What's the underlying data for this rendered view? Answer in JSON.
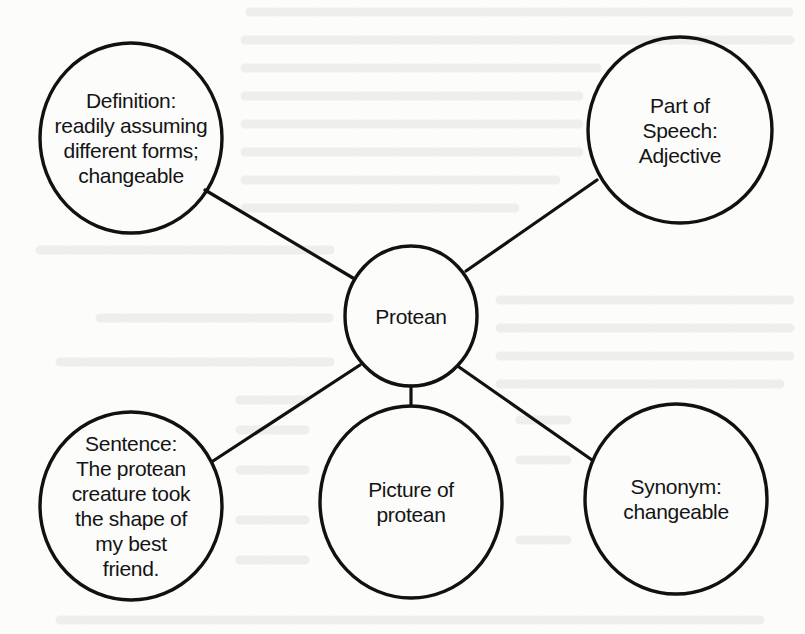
{
  "diagram": {
    "type": "word-map",
    "stroke_color": "#111111",
    "background_color": "#fcfcfb",
    "center": {
      "id": "protean",
      "label": "Protean",
      "cx": 411,
      "cy": 316,
      "rx": 66,
      "ry": 70
    },
    "nodes": [
      {
        "id": "definition",
        "label": "Definition:\nreadily assuming\ndifferent forms;\nchangeable",
        "cx": 131,
        "cy": 138,
        "rx": 91,
        "ry": 95
      },
      {
        "id": "part-of-speech",
        "label": "Part of\nSpeech:\nAdjective",
        "cx": 680,
        "cy": 130,
        "rx": 92,
        "ry": 93
      },
      {
        "id": "sentence",
        "label": "Sentence:\nThe protean\ncreature took\nthe shape of\nmy best\nfriend.",
        "cx": 131,
        "cy": 506,
        "rx": 91,
        "ry": 94
      },
      {
        "id": "picture",
        "label": "Picture of\nprotean",
        "cx": 411,
        "cy": 502,
        "rx": 91,
        "ry": 96
      },
      {
        "id": "synonym",
        "label": "Synonym:\nchangeable",
        "cx": 676,
        "cy": 499,
        "rx": 91,
        "ry": 95
      }
    ],
    "edges": [
      {
        "from": "protean",
        "to": "definition",
        "x1": 353,
        "y1": 278,
        "x2": 205,
        "y2": 190
      },
      {
        "from": "protean",
        "to": "part-of-speech",
        "x1": 466,
        "y1": 271,
        "x2": 597,
        "y2": 180
      },
      {
        "from": "protean",
        "to": "sentence",
        "x1": 360,
        "y1": 365,
        "x2": 213,
        "y2": 461
      },
      {
        "from": "protean",
        "to": "picture",
        "x1": 411,
        "y1": 386,
        "x2": 411,
        "y2": 406
      },
      {
        "from": "protean",
        "to": "synonym",
        "x1": 459,
        "y1": 367,
        "x2": 592,
        "y2": 460
      }
    ]
  }
}
